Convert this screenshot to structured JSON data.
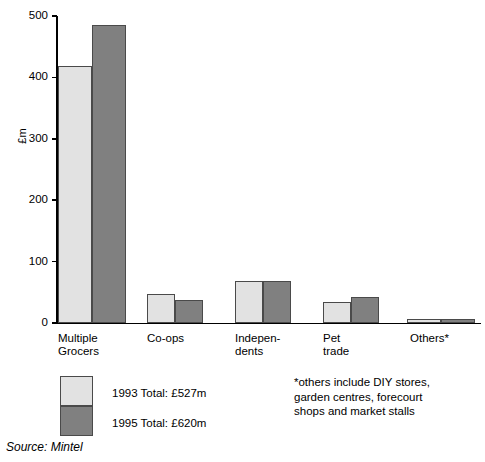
{
  "chart_data": {
    "type": "bar",
    "title": "",
    "subtitle": "",
    "xlabel": "",
    "ylabel": "£m",
    "ylim": [
      0,
      500
    ],
    "yticks": [
      0,
      100,
      200,
      300,
      400,
      500
    ],
    "ytick_labels": [
      "0",
      "100",
      "200",
      "300",
      "400",
      "500"
    ],
    "grid": false,
    "legend_position": "below-left",
    "categories": [
      "Multiple\nGrocers",
      "Co-ops",
      "Indepen-\ndents",
      "Pet\ntrade",
      "Others*"
    ],
    "series": [
      {
        "name": "1993 Total: £527m",
        "short_name": "1993",
        "color": "#e2e2e2",
        "values": [
          418,
          47,
          68,
          34,
          7
        ]
      },
      {
        "name": "1995 Total: £620m",
        "short_name": "1995",
        "color": "#808080",
        "values": [
          485,
          38,
          68,
          43,
          7
        ]
      }
    ],
    "annotations": [
      "*others include DIY stores, garden centres, forecourt shops and market stalls",
      "Source: Mintel"
    ]
  },
  "axis": {
    "y_label": "£m",
    "ticks": [
      {
        "value": 500,
        "label": "500"
      },
      {
        "value": 400,
        "label": "400"
      },
      {
        "value": 300,
        "label": "300"
      },
      {
        "value": 200,
        "label": "200"
      },
      {
        "value": 100,
        "label": "100"
      },
      {
        "value": 0,
        "label": "0"
      }
    ]
  },
  "categories": [
    {
      "id": "multiple-grocers",
      "label": "Multiple\nGrocers"
    },
    {
      "id": "co-ops",
      "label": "Co-ops"
    },
    {
      "id": "independents",
      "label": "Indepen-\ndents"
    },
    {
      "id": "pet-trade",
      "label": "Pet\ntrade"
    },
    {
      "id": "others",
      "label": "Others*"
    }
  ],
  "legend": {
    "items": [
      {
        "id": "series-1993",
        "label": "1993 Total: £527m",
        "color": "#e2e2e2"
      },
      {
        "id": "series-1995",
        "label": "1995 Total: £620m",
        "color": "#808080"
      }
    ]
  },
  "footnote": {
    "text": "*others include DIY stores,\ngarden centres, forecourt\nshops and market stalls"
  },
  "source": {
    "text": "Source: Mintel"
  },
  "colors": {
    "series_1993": "#e2e2e2",
    "series_1995": "#808080",
    "bar_border": "#4a4a4a",
    "axis": "#000000",
    "text": "#000000",
    "background": "#ffffff"
  }
}
